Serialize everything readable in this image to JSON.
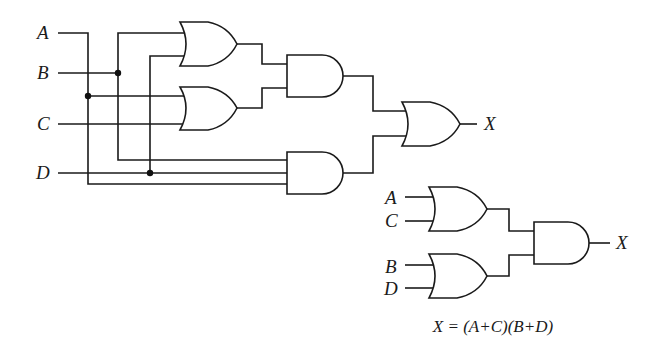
{
  "diagram": {
    "type": "logic-circuit",
    "colors": {
      "line": "#1a1a1a",
      "background": "#ffffff"
    },
    "original_circuit": {
      "inputs": [
        "A",
        "B",
        "C",
        "D"
      ],
      "output": "X",
      "gates": [
        {
          "id": "or1",
          "type": "OR",
          "inputs": [
            "B",
            "D"
          ]
        },
        {
          "id": "or2",
          "type": "OR",
          "inputs": [
            "A",
            "C"
          ]
        },
        {
          "id": "and1",
          "type": "AND",
          "inputs": [
            "or1",
            "or2"
          ]
        },
        {
          "id": "and2",
          "type": "AND",
          "inputs": [
            "B",
            "D",
            "A"
          ]
        },
        {
          "id": "or3",
          "type": "OR",
          "inputs": [
            "and1",
            "and2"
          ],
          "output": "X"
        }
      ]
    },
    "simplified_circuit": {
      "inputs": [
        "A",
        "C",
        "B",
        "D"
      ],
      "output": "X",
      "gates": [
        {
          "id": "or4",
          "type": "OR",
          "inputs": [
            "A",
            "C"
          ]
        },
        {
          "id": "or5",
          "type": "OR",
          "inputs": [
            "B",
            "D"
          ]
        },
        {
          "id": "and3",
          "type": "AND",
          "inputs": [
            "or4",
            "or5"
          ],
          "output": "X"
        }
      ]
    },
    "labels": {
      "left_A": "A",
      "left_B": "B",
      "left_C": "C",
      "left_D": "D",
      "left_X": "X",
      "right_A": "A",
      "right_C": "C",
      "right_B": "B",
      "right_D": "D",
      "right_X": "X"
    },
    "equation": "X = (A+C)(B+D)"
  }
}
